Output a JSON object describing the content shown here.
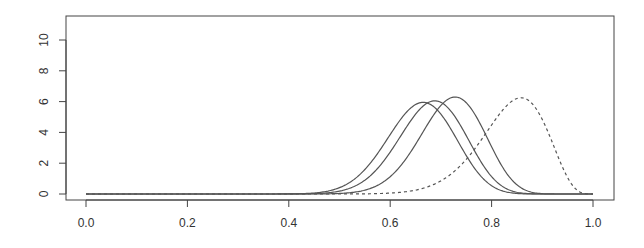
{
  "chart_data": {
    "type": "line",
    "title": "",
    "xlabel": "",
    "ylabel": "",
    "xlim": [
      0.0,
      1.0
    ],
    "ylim": [
      0,
      11
    ],
    "grid": false,
    "legend": null,
    "x_ticks": [
      "0.0",
      "0.2",
      "0.4",
      "0.6",
      "0.8",
      "1.0"
    ],
    "y_ticks": [
      "0",
      "2",
      "4",
      "6",
      "8",
      "10"
    ],
    "series": [
      {
        "name": "density-1",
        "style": "solid",
        "mode": 0.665,
        "peak": 5.95
      },
      {
        "name": "density-2",
        "style": "solid",
        "mode": 0.688,
        "peak": 6.05
      },
      {
        "name": "density-3",
        "style": "solid",
        "mode": 0.728,
        "peak": 6.3
      },
      {
        "name": "density-4",
        "style": "dashed",
        "mode": 0.858,
        "peak": 6.25
      }
    ]
  },
  "colors": {
    "line": "#555555",
    "axis": "#444444",
    "text": "#333333"
  }
}
